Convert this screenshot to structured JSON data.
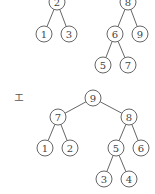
{
  "diagram": {
    "type": "binary-trees",
    "colors": {
      "stroke": "#555555",
      "text": "#444444",
      "background": "#ffffff"
    },
    "node_radius": 8,
    "trees": [
      {
        "id": "tree-top-left",
        "label": "",
        "nodes": [
          {
            "id": "n2",
            "value": "2",
            "x": 57,
            "y": 2
          },
          {
            "id": "n1",
            "value": "1",
            "x": 44,
            "y": 34
          },
          {
            "id": "n3",
            "value": "3",
            "x": 69,
            "y": 34
          }
        ],
        "edges": [
          [
            "n2",
            "n1"
          ],
          [
            "n2",
            "n3"
          ]
        ]
      },
      {
        "id": "tree-top-right",
        "label": "",
        "nodes": [
          {
            "id": "n8",
            "value": "8",
            "x": 128,
            "y": 2
          },
          {
            "id": "n6",
            "value": "6",
            "x": 115,
            "y": 34
          },
          {
            "id": "n9",
            "value": "9",
            "x": 140,
            "y": 34
          },
          {
            "id": "n5",
            "value": "5",
            "x": 103,
            "y": 65
          },
          {
            "id": "n7",
            "value": "7",
            "x": 128,
            "y": 65
          }
        ],
        "edges": [
          [
            "n8",
            "n6"
          ],
          [
            "n8",
            "n9"
          ],
          [
            "n6",
            "n5"
          ],
          [
            "n6",
            "n7"
          ]
        ]
      },
      {
        "id": "tree-e",
        "label": "エ",
        "label_pos": {
          "x": 14,
          "y": 101
        },
        "nodes": [
          {
            "id": "m9",
            "value": "9",
            "x": 93,
            "y": 98
          },
          {
            "id": "m7",
            "value": "7",
            "x": 58,
            "y": 117
          },
          {
            "id": "m8",
            "value": "8",
            "x": 129,
            "y": 117
          },
          {
            "id": "m1",
            "value": "1",
            "x": 45,
            "y": 148
          },
          {
            "id": "m2",
            "value": "2",
            "x": 70,
            "y": 148
          },
          {
            "id": "m5",
            "value": "5",
            "x": 116,
            "y": 148
          },
          {
            "id": "m6",
            "value": "6",
            "x": 141,
            "y": 148
          },
          {
            "id": "m3",
            "value": "3",
            "x": 104,
            "y": 179
          },
          {
            "id": "m4",
            "value": "4",
            "x": 129,
            "y": 179
          }
        ],
        "edges": [
          [
            "m9",
            "m7"
          ],
          [
            "m9",
            "m8"
          ],
          [
            "m7",
            "m1"
          ],
          [
            "m7",
            "m2"
          ],
          [
            "m8",
            "m5"
          ],
          [
            "m8",
            "m6"
          ],
          [
            "m5",
            "m3"
          ],
          [
            "m5",
            "m4"
          ]
        ]
      }
    ]
  }
}
